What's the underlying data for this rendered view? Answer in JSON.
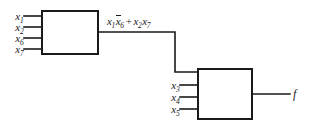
{
  "diagram": {
    "type": "logic-block-diagram",
    "background_color": "#ffffff",
    "line_color": "#1a1a1a",
    "blocks": [
      {
        "id": "block-1",
        "inputs": [
          "x1",
          "x2",
          "x6",
          "x7"
        ],
        "output_label": "x1 x6' + x2 x7"
      },
      {
        "id": "block-2",
        "inputs": [
          "block-1 output",
          "x3",
          "x4",
          "x5"
        ],
        "output_label": "f"
      }
    ]
  },
  "labels": {
    "block1_inputs": [
      {
        "base": "x",
        "sub": "1"
      },
      {
        "base": "x",
        "sub": "2"
      },
      {
        "base": "x",
        "sub": "6"
      },
      {
        "base": "x",
        "sub": "7"
      }
    ],
    "block2_inputs": [
      {
        "base": "x",
        "sub": "3"
      },
      {
        "base": "x",
        "sub": "4"
      },
      {
        "base": "x",
        "sub": "5"
      }
    ],
    "expression": {
      "term1_var": "x",
      "term1_sub": "1",
      "term1b_var": "x",
      "term1b_sub": "6",
      "operator": "+",
      "term2_var": "x",
      "term2_sub": "2",
      "term2b_var": "x",
      "term2b_sub": "7",
      "plain": "x1x6̄ + x2x7"
    },
    "output": "f"
  }
}
